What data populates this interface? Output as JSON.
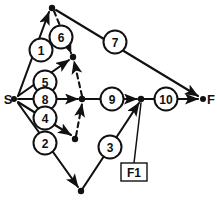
{
  "diagram": {
    "type": "activity-on-arrow-network",
    "canvas": {
      "width": 217,
      "height": 200,
      "background": "#ffffff"
    },
    "ink_color": "#111111",
    "endpoints": [
      {
        "id": "S",
        "label": "S",
        "x": 14,
        "y": 99,
        "label_x": 9,
        "label_y": 99
      },
      {
        "id": "F",
        "label": "F",
        "x": 203,
        "y": 99,
        "label_x": 210,
        "label_y": 99
      }
    ],
    "event_nodes": [
      {
        "id": "n-top",
        "x": 52,
        "y": 8
      },
      {
        "id": "n-upper-mid",
        "x": 73,
        "y": 57
      },
      {
        "id": "n-center",
        "x": 82,
        "y": 99
      },
      {
        "id": "n-lower-left",
        "x": 75,
        "y": 139
      },
      {
        "id": "n-bottom",
        "x": 81,
        "y": 191
      },
      {
        "id": "n-right",
        "x": 141,
        "y": 99
      }
    ],
    "activities": [
      {
        "id": "a1",
        "label": "1",
        "cx": 41,
        "cy": 50,
        "r": 12,
        "style": "solid",
        "from": "S",
        "to": "n-top"
      },
      {
        "id": "a6",
        "label": "6",
        "cx": 61,
        "cy": 37,
        "r": 12,
        "style": "dashed",
        "from": "n-top",
        "to": "n-upper-mid"
      },
      {
        "id": "a7",
        "label": "7",
        "cx": 115,
        "cy": 42,
        "r": 12,
        "style": "solid",
        "from": "n-top",
        "to": "F"
      },
      {
        "id": "a5",
        "label": "5",
        "cx": 45,
        "cy": 82,
        "r": 12,
        "style": "solid",
        "from": "S",
        "to": "n-upper-mid"
      },
      {
        "id": "a8",
        "label": "8",
        "cx": 45,
        "cy": 99,
        "r": 12,
        "style": "solid",
        "from": "S",
        "to": "n-center"
      },
      {
        "id": "a4",
        "label": "4",
        "cx": 45,
        "cy": 118,
        "r": 12,
        "style": "solid",
        "from": "S",
        "to": "n-lower-left"
      },
      {
        "id": "a2",
        "label": "2",
        "cx": 45,
        "cy": 143,
        "r": 12,
        "style": "solid",
        "from": "S",
        "to": "n-bottom"
      },
      {
        "id": "a9",
        "label": "9",
        "cx": 112,
        "cy": 99,
        "r": 12,
        "style": "solid",
        "from": "n-center",
        "to": "n-right"
      },
      {
        "id": "a10",
        "label": "10",
        "cx": 166,
        "cy": 99,
        "r": 12,
        "style": "solid",
        "from": "n-right",
        "to": "F"
      },
      {
        "id": "a3",
        "label": "3",
        "cx": 110,
        "cy": 147,
        "r": 12,
        "style": "solid",
        "from": "n-bottom",
        "to": "n-right"
      }
    ],
    "dummy_activities": [
      {
        "id": "d-center-up",
        "from": "n-center",
        "to": "n-upper-mid",
        "style": "dashed"
      },
      {
        "id": "d-center-down",
        "from": "n-lower-left",
        "to": "n-center",
        "style": "dashed"
      }
    ],
    "callout": {
      "id": "f1-callout",
      "text": "F1",
      "box": {
        "x": 121,
        "y": 163,
        "width": 26,
        "height": 18
      },
      "pointer_from": {
        "x": 134,
        "y": 163
      },
      "pointer_to": {
        "x": 141,
        "y": 102
      }
    }
  }
}
